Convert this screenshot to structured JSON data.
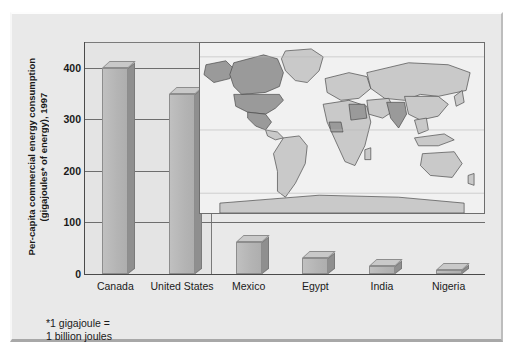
{
  "chart_data": {
    "type": "bar",
    "title": "",
    "ylabel": "Per-capita commercial energy consumption\n(gigajoules* of energy), 1997",
    "xlabel": "",
    "categories": [
      "Canada",
      "United States",
      "Mexico",
      "Egypt",
      "India",
      "Nigeria"
    ],
    "values": [
      400,
      350,
      63,
      32,
      16,
      7
    ],
    "ylim": [
      0,
      450
    ],
    "yticks": [
      0,
      100,
      200,
      300,
      400
    ],
    "ytick_labels": [
      "0",
      "100",
      "200",
      "300",
      "400"
    ],
    "grid": true,
    "legend": "none",
    "footnote": "*1 gigajoule =\n1 billion joules",
    "bar_face_color": "#b4b4b4",
    "bar_side_color": "#8f8f8f",
    "axis_color": "#4a4a4a",
    "panel_color": "#e9e9e9"
  },
  "inset_map": {
    "name": "world-map-inset",
    "highlighted_countries": [
      "Canada",
      "United States",
      "Mexico",
      "Egypt",
      "India",
      "Nigeria"
    ],
    "land_color": "#c9c9c9",
    "highlight_color": "#9a9a9a",
    "ocean_color": "#f1f1f1",
    "outline_color": "#4a4a4a"
  }
}
